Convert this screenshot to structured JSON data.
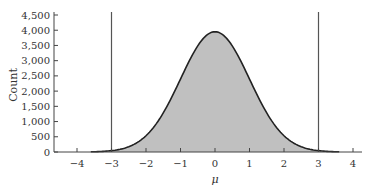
{
  "chart_data": {
    "type": "area",
    "title": "",
    "xlabel": "μ",
    "ylabel": "Count",
    "xlim": [
      -4.5,
      4.2
    ],
    "ylim": [
      0,
      4500
    ],
    "x_ticks": [
      -4,
      -3,
      -2,
      -1,
      0,
      1,
      2,
      3,
      4
    ],
    "x_tick_labels": [
      "−4",
      "−3",
      "−2",
      "−1",
      "0",
      "1",
      "2",
      "3",
      "4"
    ],
    "y_ticks": [
      0,
      500,
      1000,
      1500,
      2000,
      2500,
      3000,
      3500,
      4000,
      4500
    ],
    "y_tick_labels": [
      "0",
      "500",
      "1,000",
      "1,500",
      "2,000",
      "2,500",
      "3,000",
      "3,500",
      "4,000",
      "4,500"
    ],
    "grid": false,
    "series": [
      {
        "name": "distribution",
        "description": "Normal-shaped distribution centered at 0, sd ≈ 1, peak ≈ 3,950",
        "mean": 0,
        "sd": 1,
        "peak": 3950,
        "x": [
          -3.6,
          -3,
          -2.5,
          -2,
          -1.5,
          -1,
          -0.5,
          0,
          0.5,
          1,
          1.5,
          2,
          2.5,
          3,
          3.6
        ],
        "values": [
          6,
          44,
          173,
          535,
          1283,
          2396,
          3486,
          3950,
          3486,
          2396,
          1283,
          535,
          173,
          44,
          6
        ],
        "fill": "#c0c0c0",
        "line": "#222222",
        "shaded_range": [
          -3,
          3
        ]
      }
    ],
    "reference_lines": [
      {
        "axis": "x",
        "value": -3,
        "color": "#555555"
      },
      {
        "axis": "x",
        "value": 3,
        "color": "#555555"
      }
    ]
  }
}
